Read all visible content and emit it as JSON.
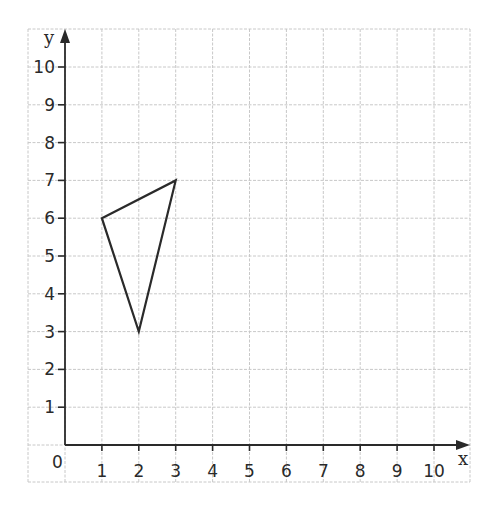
{
  "diagram": {
    "type": "coordinate-grid",
    "x_axis": {
      "label": "x",
      "min": 0,
      "max": 10,
      "ticks": [
        "1",
        "2",
        "3",
        "4",
        "5",
        "6",
        "7",
        "8",
        "9",
        "10"
      ]
    },
    "y_axis": {
      "label": "y",
      "min": 0,
      "max": 10,
      "ticks": [
        "1",
        "2",
        "3",
        "4",
        "5",
        "6",
        "7",
        "8",
        "9",
        "10"
      ]
    },
    "origin_label": "0",
    "shape": {
      "type": "triangle",
      "vertices": [
        [
          1,
          6
        ],
        [
          3,
          7
        ],
        [
          2,
          3
        ]
      ],
      "stroke": "#2a2a2a"
    },
    "colors": {
      "grid": "#c8c8c8",
      "axis": "#2a2a2a",
      "background": "#ffffff"
    }
  }
}
